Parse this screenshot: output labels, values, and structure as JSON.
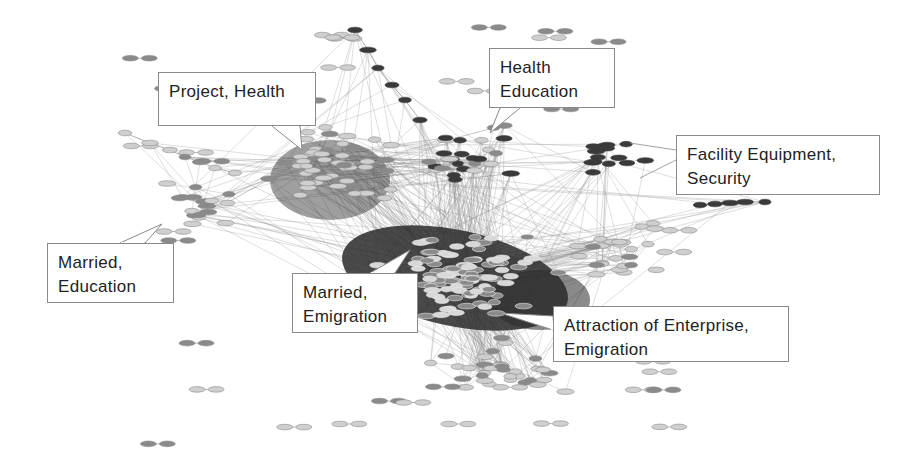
{
  "diagram": {
    "type": "network-graph",
    "colors": {
      "background": "#ffffff",
      "edge": "#8c8c8c",
      "node_light": "#cfcfcf",
      "node_mid": "#8a8a8a",
      "node_dark": "#3a3a3a",
      "dense_core": "#2a2a2a",
      "callout_border": "#8a8a8a",
      "callout_text": "#222222"
    },
    "clusters": [
      {
        "id": "project-health",
        "lines": [
          "Project, Health"
        ],
        "box": {
          "x": 158,
          "y": 72,
          "w": 158,
          "h": 54
        },
        "pointer": [
          [
            272,
            126
          ],
          [
            300,
            126
          ],
          [
            302,
            150
          ]
        ]
      },
      {
        "id": "health-education",
        "lines": [
          "Health",
          "Education"
        ],
        "box": {
          "x": 489,
          "y": 48,
          "w": 126,
          "h": 60
        },
        "pointer": [
          [
            500,
            108
          ],
          [
            520,
            108
          ],
          [
            490,
            133
          ]
        ]
      },
      {
        "id": "facility-equipment-security",
        "lines": [
          "Facility Equipment,",
          "Security"
        ],
        "box": {
          "x": 676,
          "y": 135,
          "w": 204,
          "h": 60
        },
        "leaders": [
          [
            [
              676,
              150
            ],
            [
              630,
              143
            ]
          ],
          [
            [
              676,
              160
            ],
            [
              640,
              178
            ]
          ]
        ]
      },
      {
        "id": "married-education",
        "lines": [
          "Married,",
          "Education"
        ],
        "box": {
          "x": 47,
          "y": 243,
          "w": 127,
          "h": 60
        },
        "pointer": [
          [
            120,
            243
          ],
          [
            145,
            243
          ],
          [
            162,
            224
          ]
        ]
      },
      {
        "id": "married-emigration",
        "lines": [
          "Married,",
          "Emigration"
        ],
        "box": {
          "x": 292,
          "y": 273,
          "w": 126,
          "h": 60
        },
        "pointer": [
          [
            370,
            273
          ],
          [
            395,
            273
          ],
          [
            410,
            250
          ]
        ]
      },
      {
        "id": "attraction-enterprise-emigration",
        "lines": [
          "Attraction of Enterprise,",
          "Emigration"
        ],
        "box": {
          "x": 553,
          "y": 306,
          "w": 236,
          "h": 56
        },
        "pointer": [
          [
            553,
            316
          ],
          [
            553,
            330
          ],
          [
            500,
            313
          ]
        ]
      }
    ],
    "regions": [
      {
        "name": "dense-core",
        "cx": 460,
        "cy": 275,
        "rx": 110,
        "ry": 55,
        "density": 1.0
      },
      {
        "name": "upper-left-cluster",
        "cx": 330,
        "cy": 170,
        "rx": 80,
        "ry": 45,
        "density": 0.8
      },
      {
        "name": "left-cluster",
        "cx": 200,
        "cy": 205,
        "rx": 55,
        "ry": 35,
        "density": 0.55
      },
      {
        "name": "upper-mid-cluster",
        "cx": 470,
        "cy": 160,
        "rx": 70,
        "ry": 40,
        "density": 0.6
      },
      {
        "name": "right-dark-cluster",
        "cx": 610,
        "cy": 155,
        "rx": 45,
        "ry": 30,
        "density": 0.6
      },
      {
        "name": "lower-fan",
        "cx": 500,
        "cy": 370,
        "rx": 80,
        "ry": 45,
        "density": 0.5
      },
      {
        "name": "right-mid",
        "cx": 620,
        "cy": 250,
        "rx": 60,
        "ry": 50,
        "density": 0.45
      }
    ]
  }
}
